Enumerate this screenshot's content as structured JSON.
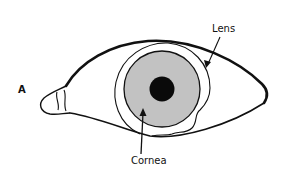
{
  "diagram": {
    "panel_label": "A",
    "labels": {
      "lens": "Lens",
      "cornea": "Cornea"
    },
    "colors": {
      "line": "#111111",
      "iris_fill": "#c2c2c2",
      "pupil_fill": "#0a0a0a",
      "background": "#ffffff"
    }
  }
}
